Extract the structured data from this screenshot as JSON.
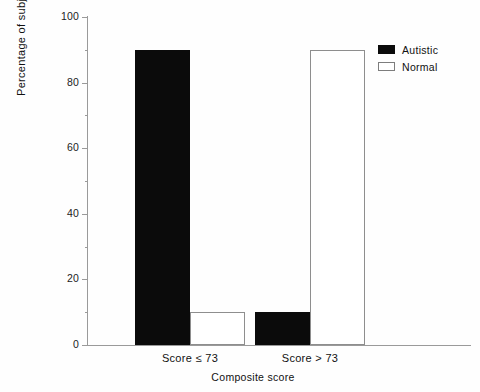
{
  "chart_data": {
    "type": "bar",
    "title": "",
    "subtitle": "",
    "xlabel": "Composite score",
    "ylabel": "Percentage of subjects",
    "categories": [
      "Score ≤ 73",
      "Score > 73"
    ],
    "series": [
      {
        "name": "Autistic",
        "values": [
          90,
          10
        ],
        "color": "#0b0b0b",
        "fill": "solid"
      },
      {
        "name": "Normal",
        "values": [
          10,
          90
        ],
        "color": "#ffffff",
        "fill": "hollow"
      }
    ],
    "ylim": [
      0,
      100
    ],
    "yticks": [
      0,
      20,
      40,
      60,
      80,
      100
    ],
    "ytick_labels": [
      "0",
      "20",
      "40",
      "60",
      "80",
      "100"
    ],
    "yminor_ticks": [
      10,
      30,
      50,
      70,
      90
    ],
    "grid": false,
    "legend_position": "top-right-outside"
  },
  "legend": {
    "entries": [
      {
        "label": "Autistic",
        "swatch": "filled-square-icon"
      },
      {
        "label": "Normal",
        "swatch": "hollow-square-icon"
      }
    ]
  },
  "axes": {
    "y_axis_label": "Percentage of subjects",
    "x_axis_label": "Composite score",
    "y_tick_labels": [
      "100",
      "80",
      "60",
      "40",
      "20",
      "0"
    ],
    "x_tick_labels": [
      "Score ≤ 73",
      "Score > 73"
    ]
  },
  "colors": {
    "autistic": "#0b0b0b",
    "normal": "#ffffff",
    "axis": "#9a9a9a",
    "text": "#111111",
    "background": "#fefefe"
  }
}
